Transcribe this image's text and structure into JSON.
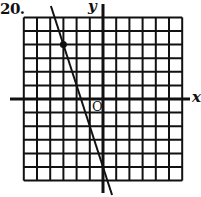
{
  "problem_number": "20.",
  "axes": {
    "x_label": "x",
    "y_label": "y",
    "origin_label": "O"
  },
  "colors": {
    "ink": "#111111",
    "background": "#ffffff"
  },
  "chart_data": {
    "type": "line",
    "title": "20.",
    "xlabel": "x",
    "ylabel": "y",
    "xlim": [
      -6,
      6
    ],
    "ylim": [
      -6,
      6
    ],
    "grid": true,
    "grid_spacing": 1,
    "annotations": [
      "O"
    ],
    "series": [
      {
        "name": "line",
        "equation": "y = -3x - 5",
        "slope": -3,
        "y_intercept": -5,
        "x_intercept": -1.67,
        "x": [
          -4.33,
          -3,
          -1.67,
          -0.33
        ],
        "y": [
          8,
          4,
          0,
          -4
        ]
      }
    ],
    "points": [
      {
        "x": -3,
        "y": 4,
        "marked": true
      }
    ]
  }
}
